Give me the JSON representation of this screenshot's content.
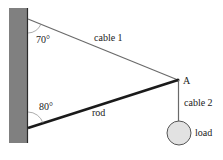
{
  "diagram": {
    "type": "statics-free-body",
    "labels": {
      "cable1": "cable 1",
      "cable2": "cable 2",
      "rod": "rod",
      "point": "A",
      "load": "load",
      "angle_top": "70°",
      "angle_bottom": "80°"
    },
    "colors": {
      "wall": "#808080",
      "wall_edge": "#2a2a2a",
      "cable": "#6a6a6a",
      "rod": "#1a1a1a",
      "load_fill": "#e2e2e2",
      "load_stroke": "#555555"
    }
  }
}
